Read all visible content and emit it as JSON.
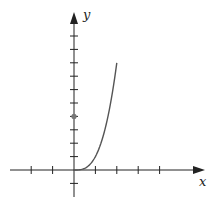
{
  "chart_data": {
    "type": "line",
    "title": "",
    "xlabel": "x",
    "ylabel": "y",
    "function": "y = x^3",
    "series": [
      {
        "name": "curve",
        "x": [
          0,
          0.25,
          0.5,
          0.75,
          1,
          1.25,
          1.5,
          1.75,
          2
        ],
        "values": [
          0,
          0.016,
          0.125,
          0.42,
          1,
          1.95,
          3.375,
          5.36,
          8
        ]
      }
    ],
    "points": [
      {
        "x": 0,
        "y": 4,
        "label": ""
      }
    ],
    "xlim": [
      -3.4,
      6.1
    ],
    "ylim": [
      -2.0,
      11.4
    ],
    "x_ticks": [
      -2,
      -1,
      1,
      2,
      3,
      4
    ],
    "y_ticks": [
      -1,
      1,
      2,
      3,
      4,
      5,
      6,
      7,
      8,
      9,
      10
    ],
    "tick_labels_shown": false,
    "grid": false,
    "legend": "none"
  },
  "layout": {
    "origin_px": [
      74,
      170
    ],
    "x_unit_px": 21.4,
    "y_unit_px": 13.4,
    "x_axis_range_px": [
      10,
      205
    ],
    "y_axis_range_px": [
      197,
      12
    ],
    "colors": {
      "axis": "#222222",
      "curve": "#555555",
      "point": "#777777"
    }
  }
}
